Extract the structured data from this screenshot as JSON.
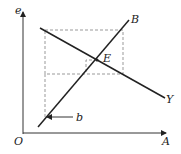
{
  "diagram": {
    "axis_labels": {
      "y": "e",
      "x": "A",
      "origin": "O"
    },
    "lines": [
      {
        "name": "B",
        "label": "B"
      },
      {
        "name": "Y",
        "label": "Y"
      }
    ],
    "point_label": "E",
    "arrow_label": "b",
    "colors": {
      "line": "#222222",
      "dashed": "#999999"
    }
  }
}
